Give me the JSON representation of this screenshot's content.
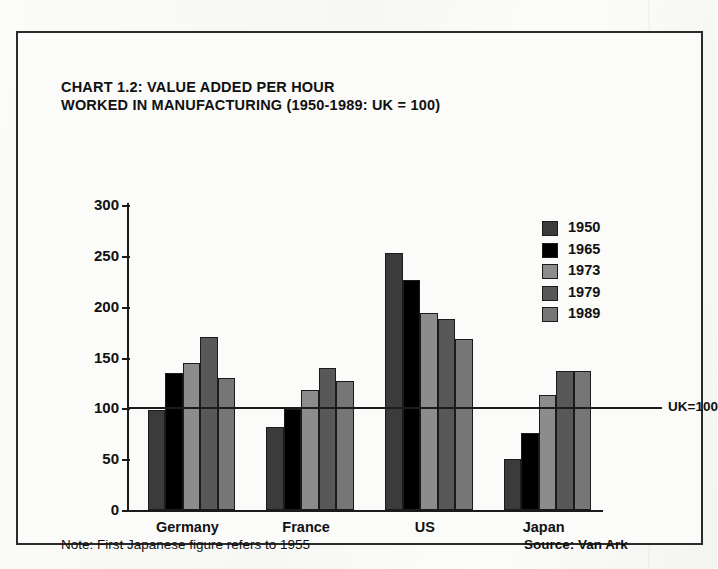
{
  "figure": {
    "title_line1": "CHART 1.2: VALUE ADDED PER HOUR",
    "title_line2": "WORKED IN MANUFACTURING (1950-1989: UK = 100)",
    "note": "Note: First Japanese figure refers to 1955",
    "source": "Source: Van Ark",
    "reference_label": "UK=100"
  },
  "chart_data": {
    "type": "bar",
    "title": "CHART 1.2: VALUE ADDED PER HOUR WORKED IN MANUFACTURING (1950-1989: UK = 100)",
    "xlabel": "",
    "ylabel": "",
    "categories": [
      "Germany",
      "France",
      "US",
      "Japan"
    ],
    "series": [
      {
        "name": "1950",
        "color": "#3b3b3b",
        "values": [
          98,
          82,
          253,
          50
        ]
      },
      {
        "name": "1965",
        "color": "#000000",
        "values": [
          135,
          99,
          226,
          76
        ]
      },
      {
        "name": "1973",
        "color": "#8c8c8c",
        "values": [
          145,
          118,
          194,
          113
        ]
      },
      {
        "name": "1979",
        "color": "#585858",
        "values": [
          170,
          140,
          188,
          137
        ]
      },
      {
        "name": "1989",
        "color": "#767676",
        "values": [
          130,
          127,
          168,
          137
        ]
      }
    ],
    "ylim": [
      0,
      300
    ],
    "yticks": [
      0,
      50,
      100,
      150,
      200,
      250,
      300
    ],
    "ytick_labels": [
      "0",
      "50",
      "100",
      "150",
      "200",
      "250",
      "300"
    ],
    "grid": false,
    "legend_position": "upper right",
    "reference_line": {
      "value": 100,
      "label": "UK=100"
    },
    "annotations": [
      "Note: First Japanese figure refers to 1955",
      "Source: Van Ark"
    ]
  }
}
